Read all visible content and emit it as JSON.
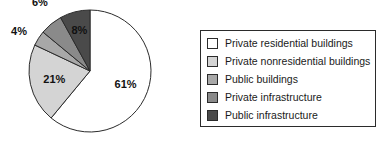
{
  "chart_data": {
    "type": "pie",
    "title": "",
    "subtitle": "",
    "xlabel": "",
    "ylabel": "",
    "legend_position": "right",
    "grid": false,
    "start_angle_deg": 0,
    "direction": "clockwise",
    "units": "percent",
    "categories": [
      "Private residential buildings",
      "Private nonresidential buildings",
      "Public buildings",
      "Private infrastructure",
      "Public infrastructure"
    ],
    "values": [
      61,
      21,
      4,
      6,
      8
    ],
    "data_labels": [
      "61%",
      "21%",
      "4%",
      "6%",
      "8%"
    ],
    "colors": [
      "#ffffff",
      "#d4d4d4",
      "#a8a8a8",
      "#8a8a8a",
      "#4a4a4a"
    ],
    "slice_outline_color": "#2b2b2b",
    "slices": [
      {
        "label": "Private residential buildings",
        "value": 61,
        "data_label": "61%",
        "color": "#ffffff"
      },
      {
        "label": "Private nonresidential buildings",
        "value": 21,
        "data_label": "21%",
        "color": "#d4d4d4"
      },
      {
        "label": "Public buildings",
        "value": 4,
        "data_label": "4%",
        "color": "#a8a8a8"
      },
      {
        "label": "Private infrastructure",
        "value": 6,
        "data_label": "6%",
        "color": "#8a8a8a"
      },
      {
        "label": "Public infrastructure",
        "value": 8,
        "data_label": "8%",
        "color": "#4a4a4a"
      }
    ]
  },
  "legend": {
    "items": [
      {
        "label": "Private residential buildings",
        "color": "#ffffff"
      },
      {
        "label": "Private nonresidential buildings",
        "color": "#d4d4d4"
      },
      {
        "label": "Public buildings",
        "color": "#a8a8a8"
      },
      {
        "label": "Private infrastructure",
        "color": "#8a8a8a"
      },
      {
        "label": "Public infrastructure",
        "color": "#4a4a4a"
      }
    ]
  }
}
